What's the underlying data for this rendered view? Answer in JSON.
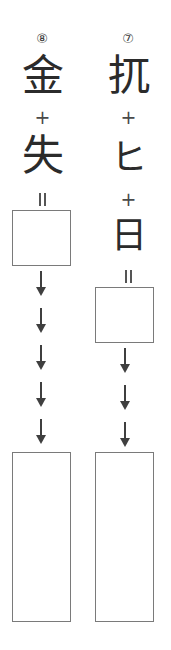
{
  "worksheet": {
    "type": "kanji-composition-exercise",
    "background_color": "#ffffff",
    "ink_color": "#2b2b2b",
    "box_border_color": "#7a7a7a",
    "columns": [
      {
        "id": "left",
        "index_label": "⑧",
        "index_number": "8",
        "components": [
          "金",
          "失"
        ],
        "operators": [
          "+"
        ],
        "equals_label": "=",
        "answer_box": {
          "label": "",
          "shape": "square"
        },
        "arrow_count": "5",
        "arrow_glyph": "↓",
        "practice_box": {
          "label": "",
          "shape": "tall-rectangle"
        }
      },
      {
        "id": "right",
        "index_label": "⑦",
        "index_number": "7",
        "components": [
          "扤",
          "ヒ",
          "日"
        ],
        "operators": [
          "+",
          "+"
        ],
        "equals_label": "=",
        "answer_box": {
          "label": "",
          "shape": "square"
        },
        "arrow_count": "3",
        "arrow_glyph": "↓",
        "practice_box": {
          "label": "",
          "shape": "tall-rectangle"
        }
      }
    ]
  }
}
